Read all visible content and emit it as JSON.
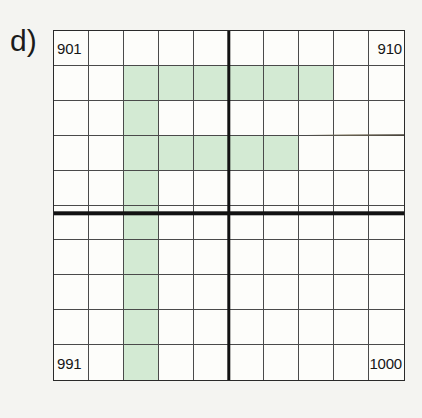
{
  "figure": {
    "panel_label": "d)",
    "type": "hundred-square-grid",
    "rows": 10,
    "columns": 10,
    "start_number": 901,
    "end_number": 1000
  },
  "colors": {
    "page_background": "#f4f4f1",
    "grid_background": "#fdfdfa",
    "grid_border": "#2a2a2a",
    "cell_line": "#4a4a4a",
    "divider_line": "#121212",
    "shaded_cell": "#d3ead3",
    "text": "#161616"
  },
  "corner_labels": {
    "top_left": "901",
    "top_right": "910",
    "bottom_left": "991",
    "bottom_right": "1000"
  },
  "grid": {
    "labeled_cells": [
      {
        "row": 1,
        "col": 1,
        "text": "901",
        "align": "left"
      },
      {
        "row": 1,
        "col": 10,
        "text": "910",
        "align": "right"
      },
      {
        "row": 10,
        "col": 1,
        "text": "991",
        "align": "left"
      },
      {
        "row": 10,
        "col": 10,
        "text": "1000",
        "align": "right"
      }
    ],
    "shaded_cells": [
      {
        "row": 2,
        "col": 3,
        "number": 913
      },
      {
        "row": 2,
        "col": 4,
        "number": 914
      },
      {
        "row": 2,
        "col": 5,
        "number": 915
      },
      {
        "row": 2,
        "col": 6,
        "number": 916
      },
      {
        "row": 2,
        "col": 7,
        "number": 917
      },
      {
        "row": 2,
        "col": 8,
        "number": 918
      },
      {
        "row": 3,
        "col": 3,
        "number": 923
      },
      {
        "row": 4,
        "col": 3,
        "number": 933
      },
      {
        "row": 4,
        "col": 4,
        "number": 934
      },
      {
        "row": 4,
        "col": 5,
        "number": 935
      },
      {
        "row": 4,
        "col": 6,
        "number": 936
      },
      {
        "row": 4,
        "col": 7,
        "number": 937
      },
      {
        "row": 5,
        "col": 3,
        "number": 943
      },
      {
        "row": 6,
        "col": 3,
        "number": 953
      },
      {
        "row": 7,
        "col": 3,
        "number": 963
      },
      {
        "row": 8,
        "col": 3,
        "number": 973
      },
      {
        "row": 9,
        "col": 3,
        "number": 983
      },
      {
        "row": 10,
        "col": 3,
        "number": 993
      }
    ]
  },
  "dividers": {
    "vertical_after_column": 5,
    "horizontal_after_row": 5
  },
  "artifact": {
    "name": "scan-streak",
    "row": 3,
    "spans_columns": "8-10"
  }
}
